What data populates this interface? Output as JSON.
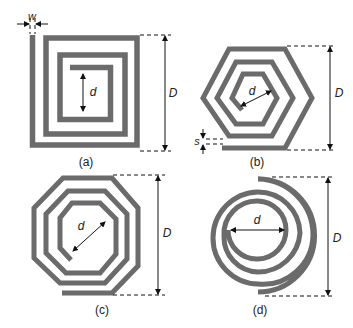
{
  "figure": {
    "panels": [
      {
        "id": "a",
        "caption": "(a)",
        "shape": "square spiral",
        "labels": {
          "width": "w",
          "inner": "d",
          "outer": "D"
        }
      },
      {
        "id": "b",
        "caption": "(b)",
        "shape": "hexagonal spiral",
        "labels": {
          "spacing": "s",
          "inner": "d",
          "outer": "D"
        }
      },
      {
        "id": "c",
        "caption": "(c)",
        "shape": "octagonal spiral",
        "labels": {
          "inner": "d",
          "outer": "D"
        }
      },
      {
        "id": "d",
        "caption": "(d)",
        "shape": "circular spiral",
        "labels": {
          "inner": "d",
          "outer": "D"
        }
      }
    ]
  },
  "colors": {
    "strip": "#6b6b6b",
    "annotation": "#111111"
  }
}
